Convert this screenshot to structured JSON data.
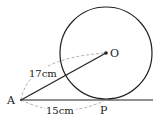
{
  "diagram": {
    "type": "geometry-tangent",
    "points": {
      "A": {
        "label": "A",
        "x": 21,
        "y": 100
      },
      "O": {
        "label": "O",
        "x": 106,
        "y": 53
      },
      "P": {
        "label": "P",
        "x": 104,
        "y": 100
      }
    },
    "circle": {
      "center": "O",
      "cx": 106,
      "cy": 53,
      "r": 46
    },
    "segments": [
      {
        "from": "A",
        "to": "O",
        "style": "solid"
      },
      {
        "from": "A",
        "to": "line-end",
        "style": "solid",
        "note": "tangent line through P"
      }
    ],
    "measurements": {
      "AO": "17cm",
      "AP": "15cm"
    },
    "colors": {
      "stroke": "#222222",
      "dashed": "#999999",
      "background": "#ffffff"
    }
  }
}
